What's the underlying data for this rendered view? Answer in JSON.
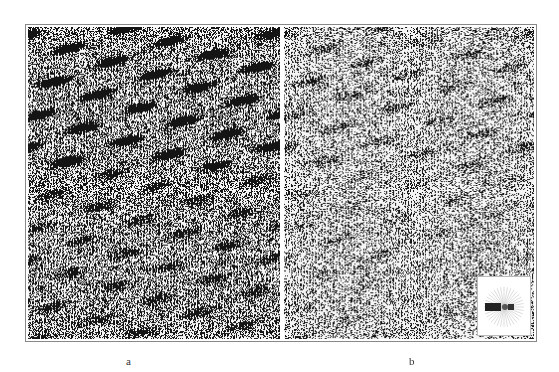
{
  "figure": {
    "panels": [
      {
        "id": "a",
        "label": "a",
        "description": "seismic section, strong coherent dipping reflections",
        "density": 0.55,
        "seed": 11
      },
      {
        "id": "b",
        "label": "b",
        "description": "seismic section, filtered/attenuated reflections",
        "density": 0.38,
        "seed": 29
      }
    ],
    "inset": {
      "description": "radial fan / polar spectrum plot",
      "rays": 36
    }
  }
}
